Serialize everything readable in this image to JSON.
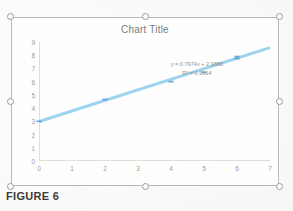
{
  "page": {
    "caption": "FIGURE 6",
    "background_color": "#f4f3f1"
  },
  "chart_object": {
    "selected": true,
    "selection_border_color": "#b9b9b9",
    "handles": [
      {
        "name": "handle-top-left"
      },
      {
        "name": "handle-top-center"
      },
      {
        "name": "handle-top-right"
      },
      {
        "name": "handle-middle-left"
      },
      {
        "name": "handle-middle-right"
      },
      {
        "name": "handle-bottom-left"
      },
      {
        "name": "handle-bottom-center"
      },
      {
        "name": "handle-bottom-right"
      }
    ]
  },
  "chart_data": {
    "type": "scatter",
    "title": "Chart Title",
    "xlabel": "",
    "ylabel": "",
    "xlim": [
      0,
      7
    ],
    "ylim": [
      0,
      9
    ],
    "xticks": [
      "0",
      "1",
      "2",
      "3",
      "4",
      "5",
      "6",
      "7"
    ],
    "yticks": [
      "0",
      "1",
      "2",
      "3",
      "4",
      "5",
      "6",
      "7",
      "8",
      "9"
    ],
    "grid": false,
    "legend": "none",
    "marker_color": "#5B9BD5",
    "trendline_color": "#9dd3ef",
    "series": [
      {
        "name": "Series 1",
        "points": [
          {
            "x": 0,
            "y": 3.0
          },
          {
            "x": 2,
            "y": 4.65
          },
          {
            "x": 4,
            "y": 6.0
          },
          {
            "x": 5,
            "y": 6.7
          },
          {
            "x": 6,
            "y": 7.75
          },
          {
            "x": 6,
            "y": 7.9
          }
        ]
      }
    ],
    "trendline": {
      "type": "linear",
      "slope": 0.7974,
      "intercept": 2.9888,
      "r_squared": 0.9914,
      "equation_text": "y = 0.7974x + 2.9888",
      "r2_text": "R² = 0.9914"
    }
  }
}
